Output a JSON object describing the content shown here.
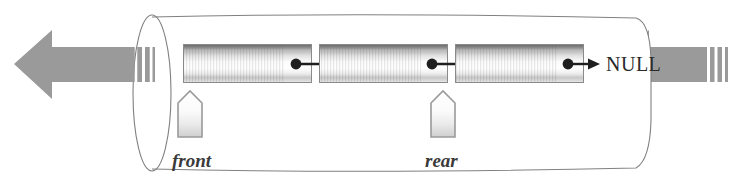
{
  "diagram": {
    "type": "linked-list-queue",
    "background_color": "#ffffff",
    "cylinder": {
      "name": "pipe-cylinder",
      "stroke_color": "#777777",
      "fill_color": "#ffffff"
    },
    "arrows": {
      "left": {
        "name": "flow-arrow-left",
        "direction": "left",
        "color": "#9a9a9a",
        "stripes": 3
      },
      "right": {
        "name": "flow-arrow-right",
        "direction": "left",
        "color": "#9a9a9a",
        "stripes": 3
      }
    },
    "nodes": [
      {
        "id": "node-1",
        "label": "",
        "pointer_label": ""
      },
      {
        "id": "node-2",
        "label": "",
        "pointer_label": ""
      },
      {
        "id": "node-3",
        "label": "",
        "pointer_label": ""
      }
    ],
    "terminator": {
      "name": "null-terminator",
      "text": "NULL",
      "color": "#2a2a2a"
    },
    "pointers": [
      {
        "name": "front-pointer",
        "label": "front",
        "marker_shape": "house",
        "marker_color": "#9a9a9a",
        "target_node": "node-1"
      },
      {
        "name": "rear-pointer",
        "label": "rear",
        "marker_shape": "house",
        "marker_color": "#9a9a9a",
        "target_node": "node-3"
      }
    ],
    "link_arrow_color": "#1f1f1f",
    "node_border_color": "#8a8a8a"
  }
}
